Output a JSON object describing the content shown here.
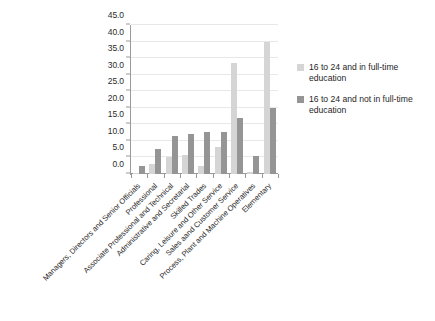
{
  "chart_data": {
    "type": "bar",
    "title": "",
    "subtitle": "",
    "xlabel": "",
    "ylabel": "",
    "ylim": [
      0,
      45
    ],
    "ytick_step": 5,
    "ytick_labels": [
      "0.0",
      "5.0",
      "10.0",
      "15.0",
      "20.0",
      "25.0",
      "30.0",
      "35.0",
      "40.0",
      "45.0"
    ],
    "grid": true,
    "legend_position": "right",
    "categories": [
      "Managers, Directors and Senior Officials",
      "Professional",
      "Associate Professional and Technical",
      "Administrative and Secretarial",
      "Skilled Trades",
      "Caring, Leisure and Other Service",
      "Sales aand Customer Service",
      "Process, Plant and Machine Operatives",
      "Elementary"
    ],
    "series": [
      {
        "name": "16 to 24 and in full-time education",
        "color": "#d5d5d5",
        "values": [
          0.2,
          3.0,
          5.2,
          5.7,
          2.5,
          8.3,
          33.5,
          0.6,
          40.0
        ]
      },
      {
        "name": "16 to 24 and not in full-time education",
        "color": "#959595",
        "values": [
          2.5,
          7.5,
          11.5,
          12.0,
          12.7,
          12.7,
          17.0,
          5.5,
          20.0
        ]
      }
    ]
  },
  "legend": {
    "items": [
      {
        "label": "16 to 24 and in full-time education"
      },
      {
        "label": "16 to 24 and not in full-time education"
      }
    ]
  }
}
